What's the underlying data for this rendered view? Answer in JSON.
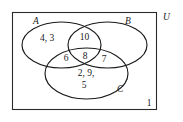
{
  "diagram": {
    "universe": {
      "label": "U",
      "outside_value": "1"
    },
    "sets": [
      {
        "key": "A",
        "label": "A"
      },
      {
        "key": "B",
        "label": "B"
      },
      {
        "key": "C",
        "label": "C"
      }
    ],
    "regions": [
      {
        "key": "A_only",
        "region": "A only",
        "value": "4, 3"
      },
      {
        "key": "AB_only",
        "region": "A and B",
        "value": "10"
      },
      {
        "key": "AC_only",
        "region": "A and C",
        "value": "6"
      },
      {
        "key": "ABC",
        "region": "A, B and C",
        "value": "8"
      },
      {
        "key": "BC_only",
        "region": "B and C",
        "value": "7"
      },
      {
        "key": "C_only_1",
        "region": "C only",
        "value": "2, 9,"
      },
      {
        "key": "C_only_2",
        "region": "C only",
        "value": "5"
      },
      {
        "key": "outside",
        "region": "outside all sets",
        "value": "1"
      }
    ],
    "colors": {
      "stroke": "#1a1a1a",
      "rect_stroke": "#2b2b2b",
      "background": "#ffffff",
      "text": "#1a1a1a"
    }
  }
}
